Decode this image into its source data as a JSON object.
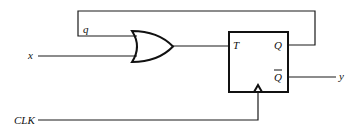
{
  "diagram": {
    "type": "sequential-logic-circuit",
    "components": {
      "or_gate": {
        "name": "OR gate",
        "inputs": [
          "q",
          "x"
        ]
      },
      "flip_flop": {
        "name": "T flip-flop",
        "input_label": "T",
        "output_label": "Q",
        "output_bar_label": "Q",
        "clock": "CLK"
      }
    },
    "labels": {
      "q": "q",
      "x": "x",
      "T": "T",
      "Q": "Q",
      "Qbar": "Q",
      "y": "y",
      "clk": "CLK"
    },
    "colors": {
      "line": "#1a1a1a",
      "background": "#ffffff"
    }
  }
}
